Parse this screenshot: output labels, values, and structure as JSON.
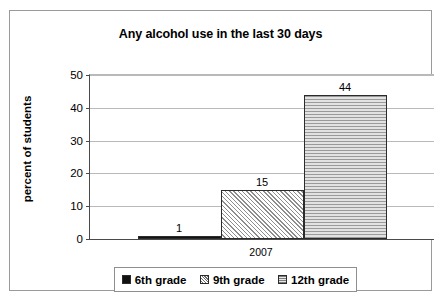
{
  "chart_data": {
    "type": "bar",
    "title": "Any alcohol use in the last 30 days",
    "xlabel": "",
    "ylabel": "percent of students",
    "categories": [
      "2007"
    ],
    "series": [
      {
        "name": "6th grade",
        "values": [
          1
        ],
        "swatch": "solid-black"
      },
      {
        "name": "9th grade",
        "values": [
          15
        ],
        "swatch": "diagonal-hatch"
      },
      {
        "name": "12th grade",
        "values": [
          44
        ],
        "swatch": "horizontal-lines"
      }
    ],
    "ylim": [
      0,
      50
    ],
    "yticks": [
      0,
      10,
      20,
      30,
      40,
      50
    ],
    "ytick_labels": [
      "0",
      "10",
      "20",
      "30",
      "40",
      "50"
    ],
    "data_labels": [
      "1",
      "15",
      "44"
    ],
    "grid": true,
    "legend_position": "bottom"
  },
  "legend": {
    "items": [
      {
        "label": "6th grade"
      },
      {
        "label": "9th grade"
      },
      {
        "label": "12th grade"
      }
    ]
  }
}
